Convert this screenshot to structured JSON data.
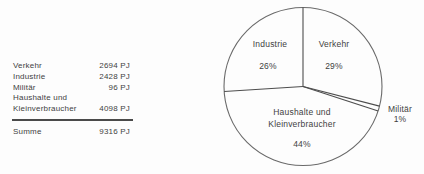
{
  "table": {
    "rows": [
      {
        "label": "Verkehr",
        "value": "2694 PJ"
      },
      {
        "label": "Industrie",
        "value": "2428 PJ"
      },
      {
        "label": "Militär",
        "value": "96 PJ"
      },
      {
        "label": "Haushalte und",
        "value": ""
      },
      {
        "label": "Kleinverbraucher",
        "value": "4098 PJ"
      }
    ],
    "summary": {
      "label": "Summe",
      "value": "9316 PJ"
    }
  },
  "chart_data": {
    "type": "pie",
    "title": "",
    "unit": "PJ",
    "direction": "clockwise",
    "start_angle_deg": 0,
    "slices": [
      {
        "label": "Verkehr",
        "value_pj": 2694,
        "percent": 29,
        "percent_label": "29%"
      },
      {
        "label": "Militär",
        "value_pj": 96,
        "percent": 1,
        "percent_label": "1%"
      },
      {
        "label": "Haushalte und Kleinverbraucher",
        "value_pj": 4098,
        "percent": 44,
        "percent_label": "44%"
      },
      {
        "label": "Industrie",
        "value_pj": 2428,
        "percent": 26,
        "percent_label": "26%"
      }
    ],
    "total": {
      "label": "Summe",
      "value_pj": 9316
    },
    "style": "outlined circle, white fill, no legend, labels inside slices (Militär labeled outside)"
  },
  "pie_labels": {
    "industrie": {
      "name": "Industrie",
      "pct": "26%"
    },
    "verkehr": {
      "name": "Verkehr",
      "pct": "29%"
    },
    "haushalte": {
      "name_line1": "Haushalte und",
      "name_line2": "Kleinverbraucher",
      "pct": "44%"
    },
    "militaer": {
      "name": "Militär",
      "pct": "1%"
    }
  },
  "colors": {
    "background": "#fdfdfd",
    "ink": "#3f3f3f",
    "line": "#4d4d4d",
    "circle_stroke": "#6a6a6a"
  }
}
